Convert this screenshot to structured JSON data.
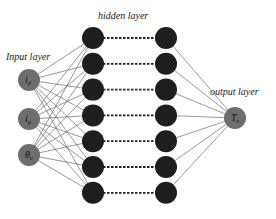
{
  "diagram": {
    "type": "neural-network",
    "labels": {
      "input_layer": "Input layer",
      "hidden_layer": "hidden layer",
      "output_layer": "output layer"
    },
    "input_nodes": [
      {
        "label": "i_d",
        "main": "i",
        "sub": "d"
      },
      {
        "label": "i_q",
        "main": "i",
        "sub": "q"
      },
      {
        "label": "θ_e",
        "main": "θ",
        "sub": "e"
      }
    ],
    "hidden_layer_columns": 2,
    "hidden_nodes_per_column": 7,
    "hidden_connection_style": "dashed",
    "output_nodes": [
      {
        "label": "T_e",
        "main": "T",
        "sub": "e"
      }
    ],
    "colors": {
      "input_node": "#6e6e6e",
      "hidden_node": "#1e1e1e",
      "output_node": "#6e6e6e",
      "edge": "#555555"
    }
  }
}
